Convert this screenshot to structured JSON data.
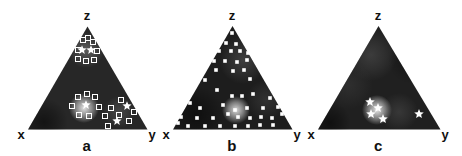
{
  "chart_data": {
    "type": "scatter",
    "subtype": "ternary-diagram-triptych",
    "title": "",
    "marker_color": "#ffffff",
    "label_color": "#111111",
    "background_color": "#ffffff",
    "panels": [
      {
        "label": "a",
        "vertex_labels": {
          "top": "z",
          "left": "x",
          "right": "y"
        },
        "triangle_px": {
          "apex": [
            87.5,
            26.5
          ],
          "left": [
            28,
            129.5
          ],
          "right": [
            147.5,
            129.5
          ]
        },
        "base_color": "#272727",
        "glows": [
          {
            "cx": 86,
            "cy": 50,
            "r": 18,
            "color": "#909090",
            "opacity": 0.5
          },
          {
            "cx": 84,
            "cy": 108,
            "r": 15,
            "color": "#eaeaea",
            "opacity": 0.95
          },
          {
            "cx": 119,
            "cy": 112,
            "r": 16,
            "color": "#787878",
            "opacity": 0.38
          },
          {
            "cx": 44,
            "cy": 122,
            "r": 24,
            "color": "#000000",
            "opacity": 0.5
          }
        ],
        "marker_sets": [
          {
            "shape": "open-square",
            "size": 5,
            "points": [
              [
                83,
                40
              ],
              [
                88,
                38
              ],
              [
                93,
                42
              ],
              [
                78,
                50
              ],
              [
                97,
                51
              ],
              [
                78,
                59
              ],
              [
                86,
                61
              ],
              [
                94,
                60
              ],
              [
                78,
                97
              ],
              [
                87,
                94
              ],
              [
                95,
                97
              ],
              [
                72,
                106
              ],
              [
                99,
                107
              ],
              [
                79,
                115
              ],
              [
                89,
                116
              ],
              [
                121,
                100
              ],
              [
                111,
                108
              ],
              [
                134,
                112
              ],
              [
                105,
                116
              ],
              [
                119,
                115
              ],
              [
                129,
                121
              ],
              [
                108,
                126
              ]
            ]
          },
          {
            "shape": "star",
            "size": 4.8,
            "points": [
              [
                82,
                50
              ],
              [
                91,
                50
              ],
              [
                86,
                105
              ],
              [
                127,
                106
              ],
              [
                117,
                121
              ]
            ]
          }
        ]
      },
      {
        "label": "b",
        "vertex_labels": {
          "top": "z",
          "left": "x",
          "right": "y"
        },
        "triangle_px": {
          "apex": [
            232.5,
            26
          ],
          "left": [
            173,
            129.5
          ],
          "right": [
            292.5,
            129.5
          ]
        },
        "base_color": "#1d1d1d",
        "glows": [
          {
            "cx": 243,
            "cy": 60,
            "r": 24,
            "color": "#5f5f5f",
            "opacity": 0.5
          },
          {
            "cx": 236,
            "cy": 110,
            "r": 14,
            "color": "#e2e2e2",
            "opacity": 0.95
          },
          {
            "cx": 266,
            "cy": 100,
            "r": 20,
            "color": "#505050",
            "opacity": 0.4
          },
          {
            "cx": 196,
            "cy": 114,
            "r": 28,
            "color": "#000000",
            "opacity": 0.5
          }
        ],
        "marker_sets": [
          {
            "shape": "filled-square",
            "size": 3.6,
            "points": [
              [
                232,
                33
              ],
              [
                226,
                43
              ],
              [
                236,
                44
              ],
              [
                219,
                51
              ],
              [
                231,
                51
              ],
              [
                240,
                51
              ],
              [
                248,
                53
              ],
              [
                214,
                61
              ],
              [
                225,
                61
              ],
              [
                237,
                62
              ],
              [
                247,
                60
              ],
              [
                216,
                70
              ],
              [
                233,
                71
              ],
              [
                244,
                70
              ],
              [
                205,
                80
              ],
              [
                250,
                79
              ],
              [
                217,
                90
              ],
              [
                232,
                96
              ],
              [
                242,
                96
              ],
              [
                253,
                94
              ],
              [
                270,
                98
              ],
              [
                190,
                103
              ],
              [
                223,
                105
              ],
              [
                200,
                108
              ],
              [
                247,
                108
              ],
              [
                263,
                108
              ],
              [
                278,
                107
              ],
              [
                235,
                110
              ],
              [
                181,
                117
              ],
              [
                197,
                118
              ],
              [
                213,
                118
              ],
              [
                228,
                114
              ],
              [
                238,
                117
              ],
              [
                250,
                118
              ],
              [
                261,
                117
              ],
              [
                272,
                118
              ],
              [
                282,
                114
              ],
              [
                178,
                123
              ],
              [
                188,
                126
              ],
              [
                205,
                126
              ],
              [
                220,
                126
              ],
              [
                235,
                126
              ],
              [
                248,
                126
              ],
              [
                260,
                125
              ],
              [
                273,
                125
              ]
            ]
          }
        ]
      },
      {
        "label": "c",
        "vertex_labels": {
          "top": "z",
          "left": "x",
          "right": "y"
        },
        "triangle_px": {
          "apex": [
            378.5,
            26
          ],
          "left": [
            318,
            129.5
          ],
          "right": [
            440.5,
            129.5
          ]
        },
        "base_color": "#202020",
        "glows": [
          {
            "cx": 371,
            "cy": 55,
            "r": 26,
            "color": "#585858",
            "opacity": 0.5
          },
          {
            "cx": 349,
            "cy": 85,
            "r": 24,
            "color": "#404040",
            "opacity": 0.45
          },
          {
            "cx": 377,
            "cy": 110,
            "r": 15,
            "color": "#eeeeee",
            "opacity": 0.95
          },
          {
            "cx": 399,
            "cy": 112,
            "r": 19,
            "color": "#5a5a5a",
            "opacity": 0.4
          },
          {
            "cx": 330,
            "cy": 123,
            "r": 21,
            "color": "#000000",
            "opacity": 0.5
          },
          {
            "cx": 412,
            "cy": 60,
            "r": 24,
            "color": "#000000",
            "opacity": 0.35
          }
        ],
        "marker_sets": [
          {
            "shape": "star",
            "size": 5,
            "points": [
              [
                370,
                102
              ],
              [
                378,
                108
              ],
              [
                371,
                114
              ],
              [
                383,
                119
              ],
              [
                419,
                114
              ]
            ]
          }
        ]
      }
    ]
  }
}
